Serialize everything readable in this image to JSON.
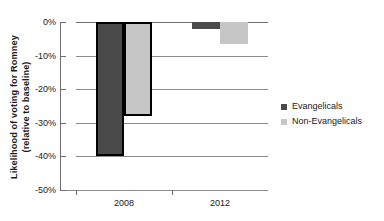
{
  "chart_data": {
    "type": "bar",
    "title": "",
    "xlabel": "",
    "ylabel": "Likelihood of voting for Romney (relative to baseline)",
    "ylabel_line1": "Likelihood of voting for Romney",
    "ylabel_line2": "(relative to baseline)",
    "categories": [
      "2008",
      "2012"
    ],
    "ylim": [
      -50,
      0
    ],
    "ytick_values": [
      0,
      -10,
      -20,
      -30,
      -40,
      -50
    ],
    "ytick_labels": [
      "0%",
      "-10%",
      "-20%",
      "-30%",
      "-40%",
      "-50%"
    ],
    "grid": true,
    "legend_position": "right",
    "series": [
      {
        "name": "Evangelicals",
        "color": "#4a4a4a",
        "values": [
          -40,
          -2
        ],
        "highlighted": [
          true,
          false
        ]
      },
      {
        "name": "Non-Evangelicals",
        "color": "#c6c6c6",
        "values": [
          -28,
          -6.5
        ],
        "highlighted": [
          true,
          false
        ]
      }
    ]
  },
  "axis": {
    "y_labels": [
      {
        "text": "0%",
        "value": 0
      },
      {
        "text": "-10%",
        "value": -10
      },
      {
        "text": "-20%",
        "value": -20
      },
      {
        "text": "-30%",
        "value": -30
      },
      {
        "text": "-40%",
        "value": -40
      },
      {
        "text": "-50%",
        "value": -50
      }
    ],
    "x_labels": [
      {
        "text": "2008",
        "value": 0
      },
      {
        "text": "2012",
        "value": 1
      }
    ]
  },
  "legend": {
    "items": [
      {
        "label": "Evangelicals",
        "color": "#4a4a4a"
      },
      {
        "label": "Non-Evangelicals",
        "color": "#c6c6c6"
      }
    ]
  }
}
